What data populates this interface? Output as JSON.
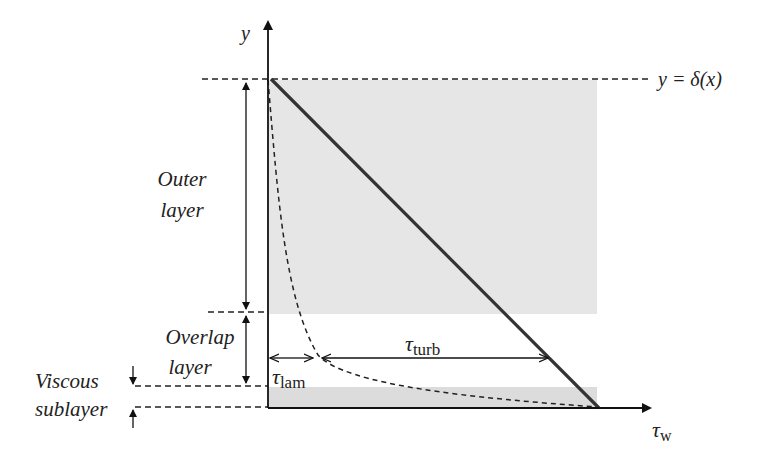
{
  "diagram": {
    "axes": {
      "y_label": "y",
      "x_label_main": "τ",
      "x_label_sub": "w"
    },
    "edge_label": "y = δ(x)",
    "regions": [
      {
        "id": "outer",
        "line1": "Outer",
        "line2": "layer"
      },
      {
        "id": "overlap",
        "line1": "Overlap",
        "line2": "layer"
      },
      {
        "id": "viscous",
        "line1": "Viscous",
        "line2": "sublayer"
      }
    ],
    "stress_components": {
      "laminar": {
        "main": "τ",
        "sub": "lam"
      },
      "turbulent": {
        "main": "τ",
        "sub": "turb"
      }
    },
    "colors": {
      "shading": "#e6e6e6",
      "lines": "#222222",
      "total_stress": "#333333"
    }
  }
}
